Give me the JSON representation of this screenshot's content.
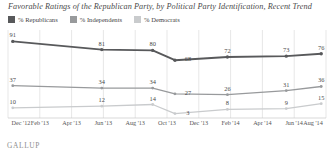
{
  "title": "Favorable Ratings of the Republican Party, by Political Party Identification, Recent Trend",
  "source_logo": "GALLUP",
  "legend": {
    "items": [
      {
        "label": "% Republicans",
        "color": "#58595b",
        "name": "republicans"
      },
      {
        "label": "% Independents",
        "color": "#989a9c",
        "name": "independents"
      },
      {
        "label": "% Democrats",
        "color": "#c9cbcd",
        "name": "democrats"
      }
    ]
  },
  "chart_data": {
    "type": "line",
    "title": "Favorable Ratings of the Republican Party, by Political Party Identification, Recent Trend",
    "xlabel": "",
    "ylabel": "",
    "ylim": [
      0,
      100
    ],
    "grid": true,
    "legend_position": "top-left",
    "x": [
      "Dec '12",
      "Feb '13",
      "Apr '13",
      "Jun '13",
      "Aug '13",
      "Oct '13",
      "Dec '13",
      "Feb '14",
      "Apr '14",
      "Jun '14",
      "Aug '14"
    ],
    "tick_labels": [
      "Dec '12",
      "Feb '13",
      "Apr '13",
      "Jun '13",
      "Aug '13",
      "Oct '13",
      "Dec '13",
      "Feb '14",
      "Apr '14",
      "Jun '14",
      "Aug '14"
    ],
    "series": [
      {
        "name": "% Republicans",
        "color": "#58595b",
        "points": [
          {
            "x": "Dec '12",
            "value": 91,
            "label": "91"
          },
          {
            "x": "Jun '13",
            "value": 81,
            "label": "81"
          },
          {
            "x": "Sep '13",
            "value": 80,
            "label": "80"
          },
          {
            "x": "Oct '13",
            "value": 68,
            "label": "68"
          },
          {
            "x": "Dec '13",
            "value": 72,
            "label": "72"
          },
          {
            "x": "Jun '14",
            "value": 73,
            "label": "73"
          },
          {
            "x": "Sep '14",
            "value": 76,
            "label": "76"
          }
        ]
      },
      {
        "name": "% Independents",
        "color": "#989a9c",
        "points": [
          {
            "x": "Dec '12",
            "value": 37,
            "label": "37"
          },
          {
            "x": "Jun '13",
            "value": 34,
            "label": "34"
          },
          {
            "x": "Sep '13",
            "value": 34,
            "label": "34"
          },
          {
            "x": "Oct '13",
            "value": 27,
            "label": "27"
          },
          {
            "x": "Dec '13",
            "value": 26,
            "label": "26"
          },
          {
            "x": "Jun '14",
            "value": 31,
            "label": "31"
          },
          {
            "x": "Sep '14",
            "value": 36,
            "label": "36"
          }
        ]
      },
      {
        "name": "% Democrats",
        "color": "#c9cbcd",
        "points": [
          {
            "x": "Dec '12",
            "value": 10,
            "label": "10"
          },
          {
            "x": "Jun '13",
            "value": 12,
            "label": "12"
          },
          {
            "x": "Sep '13",
            "value": 14,
            "label": "14"
          },
          {
            "x": "Oct '13",
            "value": 3,
            "label": "3"
          },
          {
            "x": "Dec '13",
            "value": 8,
            "label": "8"
          },
          {
            "x": "Jun '14",
            "value": 9,
            "label": "9"
          },
          {
            "x": "Sep '14",
            "value": 15,
            "label": "15"
          }
        ]
      }
    ]
  },
  "geometry": {
    "series_x_fractions": [
      0.015,
      0.295,
      0.455,
      0.525,
      0.69,
      0.875,
      0.985
    ],
    "label_dx": [
      0,
      0,
      0,
      13,
      0,
      0,
      0
    ],
    "label_dy": [
      -6,
      -6,
      -6,
      -1,
      -6,
      -6,
      -6
    ]
  }
}
